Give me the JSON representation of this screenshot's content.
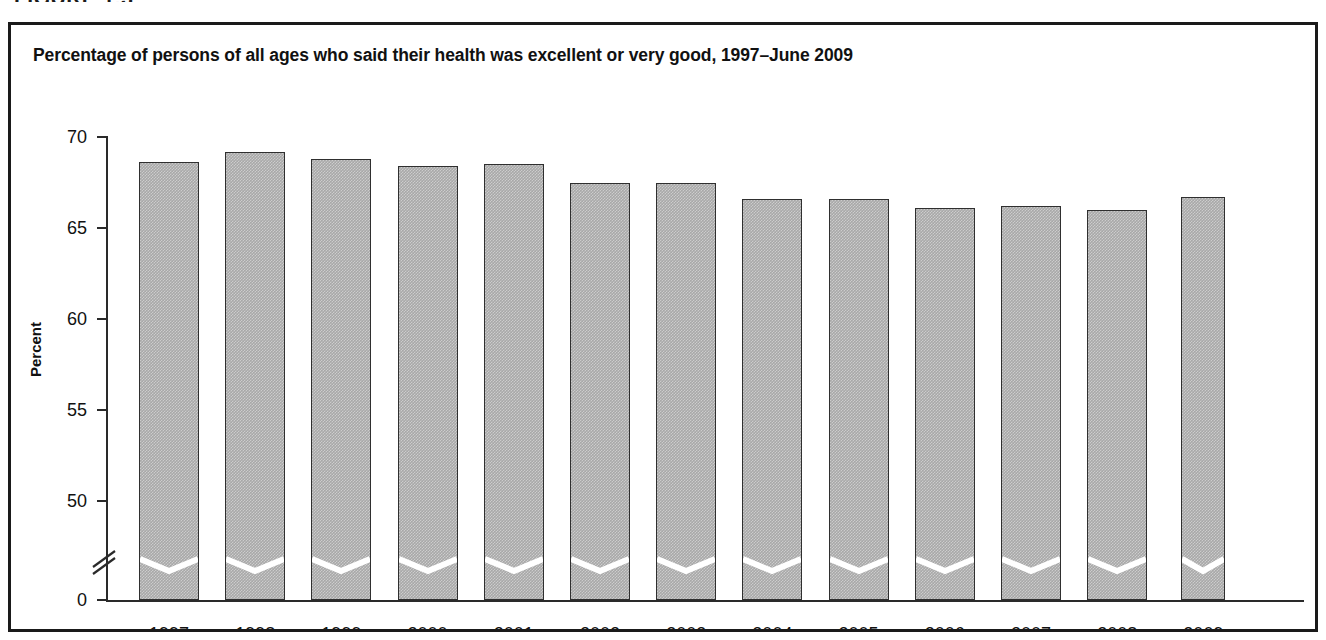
{
  "figure": {
    "label": "FIGURE 1.3"
  },
  "panel": {
    "title": "Percentage of persons of all ages who said their health was excellent or very good, 1997–June 2009"
  },
  "axis": {
    "y_title": "Percent",
    "y_ticks": [
      "70",
      "65",
      "60",
      "55",
      "50",
      "0"
    ],
    "break_symbol": "axis-break"
  },
  "colors": {
    "bar_fill": "#a8a8a8",
    "bar_border": "#2f2f2f",
    "frame": "#1a1a1a",
    "text": "#111111"
  },
  "chart_data": {
    "type": "bar",
    "title": "Percentage of persons of all ages who said their health was excellent or very good, 1997–June 2009",
    "xlabel": "",
    "ylabel": "Percent",
    "categories": [
      "1997",
      "1998",
      "1999",
      "2000",
      "2001",
      "2002",
      "2003",
      "2004",
      "2005",
      "2006",
      "2007",
      "2008",
      "2009"
    ],
    "values": [
      68.6,
      69.2,
      68.8,
      68.4,
      68.5,
      67.5,
      67.5,
      66.6,
      66.6,
      66.1,
      66.2,
      66.0,
      66.7
    ],
    "ylim": [
      0,
      70
    ],
    "ytick_values": [
      70,
      65,
      60,
      55,
      50,
      0
    ],
    "axis_break": true,
    "axis_break_between": [
      0,
      50
    ],
    "grid": false,
    "legend": null,
    "note": "Final bar (2009) covers January–June 2009 and is drawn narrower than the full-year bars."
  }
}
